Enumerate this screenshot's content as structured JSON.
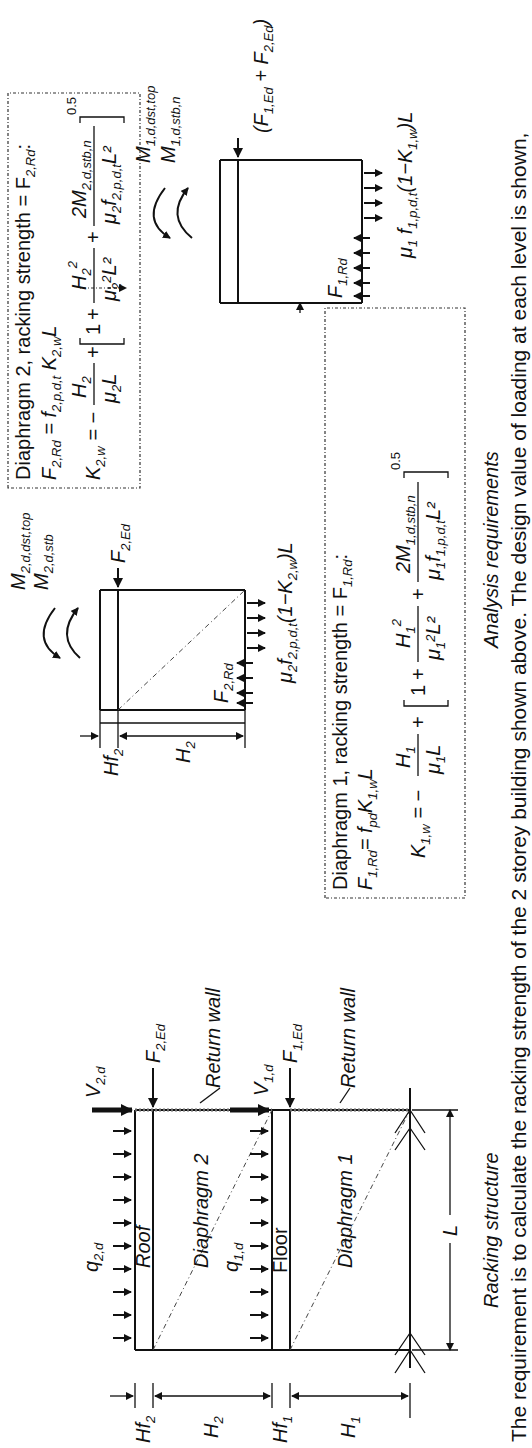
{
  "figure": {
    "caption": "The requirement is to calculate the racking strength of the 2 storey building shown above. The design value of loading at each level is shown,",
    "panels": {
      "racking_structure": {
        "title": "Racking structure",
        "labels": {
          "q2d": "q",
          "q2d_sub": "2,d",
          "q1d": "q",
          "q1d_sub": "1,d",
          "v2d": "V",
          "v2d_sub": "2,d",
          "v1d": "V",
          "v1d_sub": "1,d",
          "f2ed": "F",
          "f2ed_sub": "2,Ed",
          "f1ed": "F",
          "f1ed_sub": "1,Ed",
          "roof": "Roof",
          "floor": "Floor",
          "diaphragm2": "Diaphragm 2",
          "diaphragm1": "Diaphragm 1",
          "return_wall_top": "Return wall",
          "return_wall_bottom": "Return wall",
          "length": "L",
          "hf2": "Hf",
          "hf2_sub": "2",
          "h2": "H",
          "h2_sub": "2",
          "hf1": "Hf",
          "hf1_sub": "1",
          "h1": "H",
          "h1_sub": "1"
        }
      },
      "analysis_requirements": {
        "title": "Analysis requirements",
        "diaphragm2_block": {
          "moment_dst": "M",
          "moment_dst_sub": "2,d,dst,top",
          "moment_stb": "M",
          "moment_stb_sub": "2,d,stb",
          "f2ed": "F",
          "f2ed_sub": "2,Ed",
          "f2rd": "F",
          "f2rd_sub": "2,Rd",
          "hf2": "Hf",
          "hf2_sub": "2",
          "h2": "H",
          "h2_sub": "2",
          "base_reaction": "μ₂f₂,ₚ,d,t(1−K₂,w)L",
          "base_reaction_main": "μ",
          "base_reaction_parts": [
            "2",
            "f",
            "2,p,d,t",
            "(1−K",
            "2,w",
            ")L"
          ]
        },
        "diaphragm1_block": {
          "moment_dst": "M",
          "moment_dst_sub": "1,d,dst,top",
          "moment_stb": "M",
          "moment_stb_sub": "1,d,stb,n",
          "load": "(F",
          "load_sub1": "1,Ed",
          "load_mid": " + F",
          "load_sub2": "2,Ed",
          "load_end": ")",
          "f1rd": "F",
          "f1rd_sub": "1,Rd",
          "base_reaction_parts": [
            "μ",
            "1",
            " f",
            "1,p,d,t",
            "(1−K",
            "1,w",
            ")L"
          ]
        },
        "formula_box_2": {
          "heading": "Diaphragm 2, racking strength = F",
          "heading_sub": "2,Rd",
          "heading_end": ":",
          "eq1_lhs": "F",
          "eq1_lhs_sub": "2,Rd",
          "eq1_rhs": " = f",
          "eq1_rhs_sub": "2,p,d,t",
          "eq1_k": " K",
          "eq1_k_sub": "2,w",
          "eq1_end": "L",
          "eq2_lhs": "K",
          "eq2_lhs_sub": "2,w",
          "eq2_eq": " = −",
          "frac1_num": "H",
          "frac1_num_sub": "2",
          "frac1_den": "μ",
          "frac1_den_sub": "2",
          "frac1_den_end": "L",
          "plus": "+",
          "one": "1",
          "frac2_num": "H",
          "frac2_num_sub": "2",
          "frac2_num_sup": "2",
          "frac2_den": "μ",
          "frac2_den_sub": "2",
          "frac2_den_sup": "2",
          "frac2_den_end": "L²",
          "frac3_num": "2M",
          "frac3_num_sub": "2,d,stb,n",
          "frac3_den": "μ",
          "frac3_den_sub": "2",
          "frac3_den_f": "f",
          "frac3_den_f_sub": "2,p,d,t",
          "frac3_den_end": "L²",
          "exponent": "0.5"
        },
        "formula_box_1": {
          "heading": "Diaphragm 1, racking strength = F",
          "heading_sub": "1,Rd",
          "heading_end": ":",
          "eq1_lhs": "F",
          "eq1_lhs_sub": "1,Rd",
          "eq1_rhs": "= f",
          "eq1_rhs_sub": "pd",
          "eq1_k": "K",
          "eq1_k_sub": "1,w",
          "eq1_end": "L",
          "eq2_lhs": "K",
          "eq2_lhs_sub": "1,w",
          "eq2_eq": " = −",
          "frac1_num": "H",
          "frac1_num_sub": "1",
          "frac1_den": "μ",
          "frac1_den_sub": "1",
          "frac1_den_end": "L",
          "plus": "+",
          "one": "1",
          "frac2_num": "H",
          "frac2_num_sub": "1",
          "frac2_num_sup": "2",
          "frac2_den": "μ",
          "frac2_den_sub": "1",
          "frac2_den_sup": "2",
          "frac2_den_end": "L²",
          "frac3_num": "2M",
          "frac3_num_sub": "1,d,stb,n",
          "frac3_den": "μ",
          "frac3_den_sub": "1",
          "frac3_den_f": "f",
          "frac3_den_f_sub": "1,p,d,t",
          "frac3_den_end": "L²",
          "exponent": "0.5"
        }
      }
    }
  }
}
